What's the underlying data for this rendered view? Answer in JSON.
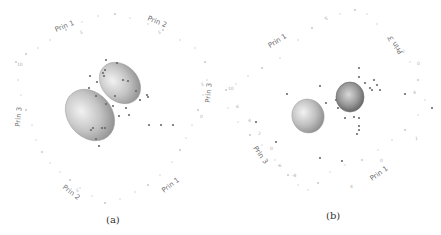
{
  "chart_data": [
    {
      "type": "scatter",
      "panel": "a",
      "caption": "(a)",
      "title": "",
      "view": "3D principal component scatter with 95% confidence ellipsoids",
      "axis_labels": {
        "prin1_top": "Prin 1",
        "prin2_top": "Prin 2",
        "prin3_left": "Prin 3",
        "prin3_right": "Prin 3",
        "prin2_bottom": "Prin 2",
        "prin1_bottom": "Prin 1"
      },
      "tick_labels": [
        "10",
        "5",
        "0",
        "-5",
        "10",
        "5",
        "0",
        "-5"
      ],
      "groups": [
        {
          "name": "group-1",
          "color": "#9a9a9a",
          "ellipsoid": "left"
        },
        {
          "name": "group-2",
          "color": "#8a8a8a",
          "ellipsoid": "right"
        }
      ],
      "points_note": "approximate scattered data points, grey"
    },
    {
      "type": "scatter",
      "panel": "b",
      "caption": "(b)",
      "title": "",
      "view": "3D principal component scatter with 95% confidence ellipsoids (rotated view)",
      "axis_labels": {
        "prin1_top": "Prin 1",
        "prin3_right": "Prin 3",
        "prin3_left": "Prin 3",
        "prin1_bottom": "Prin 1"
      },
      "tick_labels": [
        "10",
        "6",
        "4",
        "2",
        "0",
        "-2",
        "-4",
        "-6",
        "-8",
        "5",
        "0",
        "2",
        "4",
        "8"
      ],
      "groups": [
        {
          "name": "group-1",
          "color": "#9a9a9a",
          "ellipsoid": "left"
        },
        {
          "name": "group-2",
          "color": "#7a7a7a",
          "ellipsoid": "right"
        }
      ],
      "points_note": "approximate scattered data points, grey"
    }
  ],
  "captions": {
    "a": "(a)",
    "b": "(b)"
  }
}
